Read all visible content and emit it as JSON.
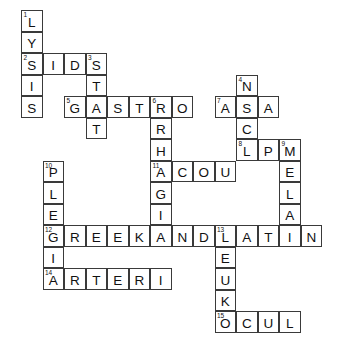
{
  "puzzle": {
    "type": "crossword-grid",
    "title": "Medical terminology crossword",
    "grid": {
      "cell_size": 21.5,
      "origin_x": 21,
      "origin_y": 10,
      "columns": 15,
      "rows": 16,
      "border_color": "#3a3a3a",
      "cell_fill": "#ffffff",
      "text_color": "#111111",
      "background": "#ffffff"
    },
    "entries": [
      {
        "number": "1",
        "answer": "LYSIS",
        "direction": "down",
        "row": 0,
        "col": 0
      },
      {
        "number": "2",
        "answer": "SIDS",
        "direction": "across",
        "row": 2,
        "col": 0
      },
      {
        "number": "3",
        "answer": "STAT",
        "direction": "down",
        "row": 2,
        "col": 3
      },
      {
        "number": "4",
        "answer": "NACL",
        "direction": "down",
        "row": 3,
        "col": 10
      },
      {
        "number": "5",
        "answer": "GASTRO",
        "direction": "across",
        "row": 4,
        "col": 2
      },
      {
        "number": "6",
        "answer": "RRHAGI",
        "direction": "down",
        "row": 4,
        "col": 6
      },
      {
        "number": "7",
        "answer": "ASA",
        "direction": "across",
        "row": 4,
        "col": 9
      },
      {
        "number": "8",
        "answer": "LPM",
        "direction": "across",
        "row": 6,
        "col": 11
      },
      {
        "number": "9",
        "answer": "MELAN",
        "direction": "down",
        "row": 6,
        "col": 13
      },
      {
        "number": "10",
        "answer": "PLEGIA",
        "direction": "down",
        "row": 7,
        "col": 1
      },
      {
        "number": "11",
        "answer": "ACOU",
        "direction": "across",
        "row": 7,
        "col": 6
      },
      {
        "number": "12",
        "answer": "GREEKANDLATIN",
        "direction": "across",
        "row": 10,
        "col": 1
      },
      {
        "number": "13",
        "answer": "LEUKO",
        "direction": "down",
        "row": 10,
        "col": 9
      },
      {
        "number": "14",
        "answer": "ARTERI",
        "direction": "across",
        "row": 12,
        "col": 1
      },
      {
        "number": "15",
        "answer": "OCUL",
        "direction": "across",
        "row": 14,
        "col": 9
      }
    ],
    "cells": [
      {
        "row": 0,
        "col": 0,
        "letter": "L",
        "number": "1"
      },
      {
        "row": 1,
        "col": 0,
        "letter": "Y",
        "number": ""
      },
      {
        "row": 2,
        "col": 0,
        "letter": "S",
        "number": "2"
      },
      {
        "row": 2,
        "col": 1,
        "letter": "I",
        "number": ""
      },
      {
        "row": 2,
        "col": 2,
        "letter": "D",
        "number": ""
      },
      {
        "row": 2,
        "col": 3,
        "letter": "S",
        "number": "3"
      },
      {
        "row": 3,
        "col": 0,
        "letter": "I",
        "number": ""
      },
      {
        "row": 3,
        "col": 3,
        "letter": "T",
        "number": ""
      },
      {
        "row": 3,
        "col": 10,
        "letter": "N",
        "number": "4"
      },
      {
        "row": 4,
        "col": 0,
        "letter": "S",
        "number": ""
      },
      {
        "row": 4,
        "col": 2,
        "letter": "G",
        "number": "5"
      },
      {
        "row": 4,
        "col": 3,
        "letter": "A",
        "number": ""
      },
      {
        "row": 4,
        "col": 4,
        "letter": "S",
        "number": ""
      },
      {
        "row": 4,
        "col": 5,
        "letter": "T",
        "number": ""
      },
      {
        "row": 4,
        "col": 6,
        "letter": "R",
        "number": "6"
      },
      {
        "row": 4,
        "col": 7,
        "letter": "O",
        "number": ""
      },
      {
        "row": 4,
        "col": 9,
        "letter": "A",
        "number": "7"
      },
      {
        "row": 4,
        "col": 10,
        "letter": "S",
        "number": ""
      },
      {
        "row": 4,
        "col": 11,
        "letter": "A",
        "number": ""
      },
      {
        "row": 5,
        "col": 3,
        "letter": "T",
        "number": ""
      },
      {
        "row": 5,
        "col": 6,
        "letter": "R",
        "number": ""
      },
      {
        "row": 5,
        "col": 10,
        "letter": "C",
        "number": ""
      },
      {
        "row": 6,
        "col": 6,
        "letter": "H",
        "number": ""
      },
      {
        "row": 6,
        "col": 10,
        "letter": "L",
        "number": "8"
      },
      {
        "row": 6,
        "col": 11,
        "letter": "P",
        "number": ""
      },
      {
        "row": 6,
        "col": 12,
        "letter": "M",
        "number": "9"
      },
      {
        "row": 7,
        "col": 1,
        "letter": "P",
        "number": "10"
      },
      {
        "row": 7,
        "col": 6,
        "letter": "A",
        "number": "11"
      },
      {
        "row": 7,
        "col": 7,
        "letter": "C",
        "number": ""
      },
      {
        "row": 7,
        "col": 8,
        "letter": "O",
        "number": ""
      },
      {
        "row": 7,
        "col": 9,
        "letter": "U",
        "number": ""
      },
      {
        "row": 7,
        "col": 12,
        "letter": "E",
        "number": ""
      },
      {
        "row": 8,
        "col": 1,
        "letter": "L",
        "number": ""
      },
      {
        "row": 8,
        "col": 6,
        "letter": "G",
        "number": ""
      },
      {
        "row": 8,
        "col": 12,
        "letter": "L",
        "number": ""
      },
      {
        "row": 9,
        "col": 1,
        "letter": "E",
        "number": ""
      },
      {
        "row": 9,
        "col": 6,
        "letter": "I",
        "number": ""
      },
      {
        "row": 9,
        "col": 12,
        "letter": "A",
        "number": ""
      },
      {
        "row": 10,
        "col": 1,
        "letter": "G",
        "number": "12"
      },
      {
        "row": 10,
        "col": 2,
        "letter": "R",
        "number": ""
      },
      {
        "row": 10,
        "col": 3,
        "letter": "E",
        "number": ""
      },
      {
        "row": 10,
        "col": 4,
        "letter": "E",
        "number": ""
      },
      {
        "row": 10,
        "col": 5,
        "letter": "K",
        "number": ""
      },
      {
        "row": 10,
        "col": 6,
        "letter": "A",
        "number": ""
      },
      {
        "row": 10,
        "col": 7,
        "letter": "N",
        "number": ""
      },
      {
        "row": 10,
        "col": 8,
        "letter": "D",
        "number": ""
      },
      {
        "row": 10,
        "col": 9,
        "letter": "L",
        "number": "13"
      },
      {
        "row": 10,
        "col": 10,
        "letter": "A",
        "number": ""
      },
      {
        "row": 10,
        "col": 11,
        "letter": "T",
        "number": ""
      },
      {
        "row": 10,
        "col": 12,
        "letter": "I",
        "number": ""
      },
      {
        "row": 10,
        "col": 13,
        "letter": "N",
        "number": ""
      },
      {
        "row": 11,
        "col": 1,
        "letter": "I",
        "number": ""
      },
      {
        "row": 11,
        "col": 9,
        "letter": "E",
        "number": ""
      },
      {
        "row": 12,
        "col": 1,
        "letter": "A",
        "number": "14"
      },
      {
        "row": 12,
        "col": 2,
        "letter": "R",
        "number": ""
      },
      {
        "row": 12,
        "col": 3,
        "letter": "T",
        "number": ""
      },
      {
        "row": 12,
        "col": 4,
        "letter": "E",
        "number": ""
      },
      {
        "row": 12,
        "col": 5,
        "letter": "R",
        "number": ""
      },
      {
        "row": 12,
        "col": 6,
        "letter": "I",
        "number": ""
      },
      {
        "row": 12,
        "col": 9,
        "letter": "U",
        "number": ""
      },
      {
        "row": 13,
        "col": 9,
        "letter": "K",
        "number": ""
      },
      {
        "row": 14,
        "col": 9,
        "letter": "O",
        "number": "15"
      },
      {
        "row": 14,
        "col": 10,
        "letter": "C",
        "number": ""
      },
      {
        "row": 14,
        "col": 11,
        "letter": "U",
        "number": ""
      },
      {
        "row": 14,
        "col": 12,
        "letter": "L",
        "number": ""
      }
    ]
  }
}
